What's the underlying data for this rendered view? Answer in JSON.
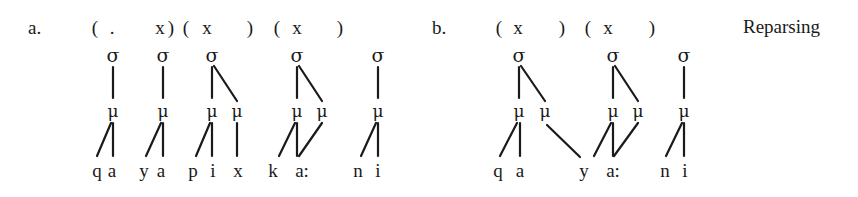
{
  "title": "Reparsing",
  "symbols": {
    "syllable": "σ",
    "mora": "μ"
  },
  "panels": [
    {
      "label": "a.",
      "label_pos": [
        28,
        34
      ],
      "feet": [
        {
          "text": "(",
          "x": 95
        },
        {
          "text": ".",
          "x": 112
        },
        {
          "text": "x",
          "x": 160
        },
        {
          "text": ")",
          "x": 171
        },
        {
          "text": "(",
          "x": 186
        },
        {
          "text": "x",
          "x": 207
        },
        {
          "text": ")",
          "x": 250
        },
        {
          "text": "(",
          "x": 277
        },
        {
          "text": "x",
          "x": 297
        },
        {
          "text": ")",
          "x": 340
        }
      ],
      "syllables": [
        113,
        163,
        212,
        297,
        378
      ],
      "moras": [
        113,
        163,
        212,
        237,
        297,
        322,
        378
      ],
      "segments": [
        {
          "text": "q",
          "x": 97
        },
        {
          "text": "a",
          "x": 112
        },
        {
          "text": "y",
          "x": 144
        },
        {
          "text": "a",
          "x": 161
        },
        {
          "text": "p",
          "x": 193
        },
        {
          "text": "i",
          "x": 213
        },
        {
          "text": "x",
          "x": 238
        },
        {
          "text": "k",
          "x": 273
        },
        {
          "text": "a:",
          "x": 302
        },
        {
          "text": "n",
          "x": 358
        },
        {
          "text": "i",
          "x": 378
        }
      ],
      "lines": [
        [
          113,
          67,
          113,
          98
        ],
        [
          163,
          67,
          163,
          98
        ],
        [
          212,
          67,
          212,
          98
        ],
        [
          214,
          66,
          237,
          101
        ],
        [
          297,
          67,
          297,
          98
        ],
        [
          299,
          66,
          322,
          101
        ],
        [
          378,
          67,
          378,
          98
        ],
        [
          111,
          123,
          97,
          156
        ],
        [
          113,
          123,
          113,
          156
        ],
        [
          161,
          123,
          146,
          156
        ],
        [
          163,
          123,
          163,
          156
        ],
        [
          210,
          123,
          196,
          156
        ],
        [
          212,
          123,
          212,
          156
        ],
        [
          237,
          123,
          237,
          156
        ],
        [
          295,
          123,
          279,
          156
        ],
        [
          297,
          123,
          297,
          156
        ],
        [
          322,
          123,
          299,
          156
        ],
        [
          376,
          123,
          361,
          156
        ],
        [
          378,
          123,
          378,
          156
        ]
      ]
    },
    {
      "label": "b.",
      "label_pos": [
        432,
        34
      ],
      "feet": [
        {
          "text": "(",
          "x": 499
        },
        {
          "text": "x",
          "x": 518
        },
        {
          "text": ")",
          "x": 562
        },
        {
          "text": "(",
          "x": 588
        },
        {
          "text": "x",
          "x": 608
        },
        {
          "text": ")",
          "x": 652
        }
      ],
      "syllables": [
        519,
        613,
        684
      ],
      "moras": [
        519,
        545,
        613,
        638,
        684
      ],
      "segments": [
        {
          "text": "q",
          "x": 498
        },
        {
          "text": "a",
          "x": 520
        },
        {
          "text": "y",
          "x": 584
        },
        {
          "text": "a:",
          "x": 613
        },
        {
          "text": "n",
          "x": 665
        },
        {
          "text": "i",
          "x": 685
        }
      ],
      "lines": [
        [
          519,
          67,
          519,
          98
        ],
        [
          521,
          66,
          545,
          101
        ],
        [
          613,
          67,
          613,
          98
        ],
        [
          615,
          66,
          638,
          101
        ],
        [
          684,
          67,
          684,
          98
        ],
        [
          517,
          123,
          500,
          156
        ],
        [
          520,
          123,
          520,
          156
        ],
        [
          547,
          125,
          580,
          157
        ],
        [
          611,
          123,
          594,
          156
        ],
        [
          613,
          123,
          613,
          156
        ],
        [
          638,
          123,
          614,
          156
        ],
        [
          682,
          123,
          666,
          156
        ],
        [
          684,
          123,
          684,
          156
        ]
      ]
    }
  ]
}
